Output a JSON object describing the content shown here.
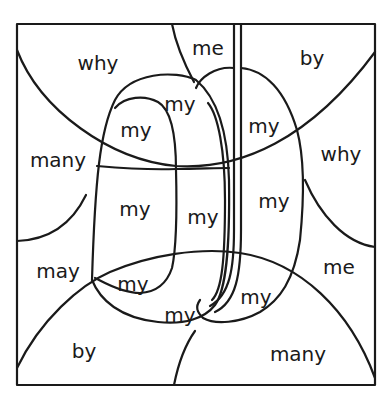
{
  "puzzle": {
    "type": "color-by-word",
    "ink_color": "#1a1a1a",
    "background": "#ffffff",
    "regions": [
      {
        "id": "why-top-left",
        "word": "why",
        "x": 98,
        "y": 63
      },
      {
        "id": "me-top",
        "word": "me",
        "x": 208,
        "y": 48
      },
      {
        "id": "by-top-right",
        "word": "by",
        "x": 312,
        "y": 58
      },
      {
        "id": "my-1",
        "word": "my",
        "x": 180,
        "y": 104
      },
      {
        "id": "my-2",
        "word": "my",
        "x": 136,
        "y": 130
      },
      {
        "id": "my-3",
        "word": "my",
        "x": 264,
        "y": 126
      },
      {
        "id": "many-left",
        "word": "many",
        "x": 58,
        "y": 160
      },
      {
        "id": "why-right",
        "word": "why",
        "x": 341,
        "y": 154
      },
      {
        "id": "my-4",
        "word": "my",
        "x": 135,
        "y": 209
      },
      {
        "id": "my-5",
        "word": "my",
        "x": 203,
        "y": 217
      },
      {
        "id": "my-6",
        "word": "my",
        "x": 274,
        "y": 201
      },
      {
        "id": "may-left",
        "word": "may",
        "x": 58,
        "y": 271
      },
      {
        "id": "me-right",
        "word": "me",
        "x": 339,
        "y": 267
      },
      {
        "id": "my-7",
        "word": "my",
        "x": 133,
        "y": 284
      },
      {
        "id": "my-8",
        "word": "my",
        "x": 180,
        "y": 315
      },
      {
        "id": "my-9",
        "word": "my",
        "x": 256,
        "y": 297
      },
      {
        "id": "by-bottom-left",
        "word": "by",
        "x": 84,
        "y": 351
      },
      {
        "id": "many-bottom-right",
        "word": "many",
        "x": 298,
        "y": 354
      }
    ]
  }
}
